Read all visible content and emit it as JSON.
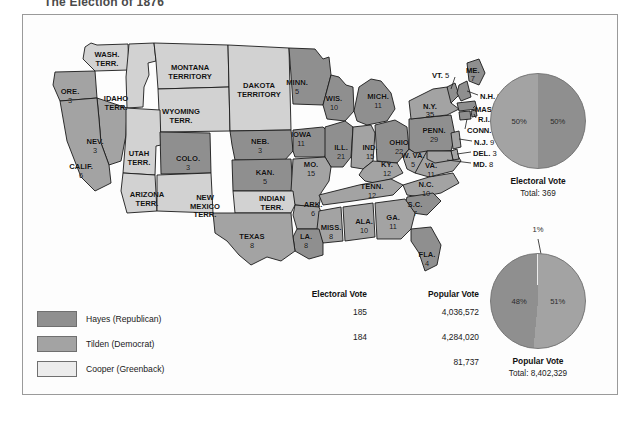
{
  "page_title": "The Election of 1876",
  "colors": {
    "hayes": "#8f8f8f",
    "tilden": "#a3a3a3",
    "cooper": "#ececec",
    "territory": "#d2d2d2",
    "outline": "#1a1a1a",
    "frame": "#9a9a9a"
  },
  "map": {
    "states": [
      {
        "name": "WASH.\nTERR.",
        "label": "WASH.",
        "label2": "TERR.",
        "ev": "",
        "party": "territory",
        "x": 84,
        "y": 42
      },
      {
        "name": "ORE.",
        "label": "ORE.",
        "label2": "",
        "ev": "3",
        "party": "tilden",
        "x": 47,
        "y": 79
      },
      {
        "name": "IDAHO TERR.",
        "label": "IDAHO",
        "label2": "TERR.",
        "ev": "",
        "party": "territory",
        "x": 93,
        "y": 86
      },
      {
        "name": "MONTANA TERRITORY",
        "label": "MONTANA",
        "label2": "TERRITORY",
        "ev": "",
        "party": "territory",
        "x": 167,
        "y": 55
      },
      {
        "name": "WYOMING TERR.",
        "label": "WYOMING",
        "label2": "TERR.",
        "ev": "",
        "party": "territory",
        "x": 158,
        "y": 99
      },
      {
        "name": "DAKOTA TERRITORY",
        "label": "DAKOTA",
        "label2": "TERRITORY",
        "ev": "",
        "party": "territory",
        "x": 236,
        "y": 73
      },
      {
        "name": "MINN.",
        "label": "MINN.",
        "label2": "",
        "ev": "5",
        "party": "hayes",
        "x": 274,
        "y": 70
      },
      {
        "name": "WIS.",
        "label": "WIS.",
        "label2": "",
        "ev": "10",
        "party": "hayes",
        "x": 311,
        "y": 86
      },
      {
        "name": "MICH.",
        "label": "MICH.",
        "label2": "",
        "ev": "11",
        "party": "hayes",
        "x": 355,
        "y": 84
      },
      {
        "name": "NEV.",
        "label": "NEV.",
        "label2": "",
        "ev": "3",
        "party": "tilden",
        "x": 72,
        "y": 129
      },
      {
        "name": "CALIF.",
        "label": "CALIF.",
        "label2": "",
        "ev": "6",
        "party": "tilden",
        "x": 58,
        "y": 154
      },
      {
        "name": "UTAH TERR.",
        "label": "UTAH",
        "label2": "TERR.",
        "ev": "",
        "party": "territory",
        "x": 116,
        "y": 141
      },
      {
        "name": "COLO.",
        "label": "COLO.",
        "label2": "",
        "ev": "3",
        "party": "hayes",
        "x": 165,
        "y": 146
      },
      {
        "name": "NEB.",
        "label": "NEB.",
        "label2": "",
        "ev": "3",
        "party": "hayes",
        "x": 237,
        "y": 129
      },
      {
        "name": "IOWA",
        "label": "IOWA",
        "label2": "",
        "ev": "11",
        "party": "hayes",
        "x": 278,
        "y": 122
      },
      {
        "name": "ILL.",
        "label": "ILL.",
        "label2": "",
        "ev": "21",
        "party": "hayes",
        "x": 318,
        "y": 135
      },
      {
        "name": "IND.",
        "label": "IND.",
        "label2": "",
        "ev": "15",
        "party": "tilden",
        "x": 347,
        "y": 135
      },
      {
        "name": "OHIO",
        "label": "OHIO",
        "label2": "",
        "ev": "22",
        "party": "hayes",
        "x": 376,
        "y": 130
      },
      {
        "name": "PENN.",
        "label": "PENN.",
        "label2": "",
        "ev": "29",
        "party": "hayes",
        "x": 411,
        "y": 118
      },
      {
        "name": "ARIZONA TERR.",
        "label": "ARIZONA",
        "label2": "TERR.",
        "ev": "",
        "party": "territory",
        "x": 124,
        "y": 182
      },
      {
        "name": "NEW MEXICO TERR.",
        "label": "NEW",
        "label2": "MEXICO",
        "label3": "TERR.",
        "ev": "",
        "party": "territory",
        "x": 182,
        "y": 185
      },
      {
        "name": "KAN.",
        "label": "KAN.",
        "label2": "",
        "ev": "5",
        "party": "hayes",
        "x": 242,
        "y": 160
      },
      {
        "name": "MO.",
        "label": "MO.",
        "label2": "",
        "ev": "15",
        "party": "tilden",
        "x": 288,
        "y": 152
      },
      {
        "name": "KY.",
        "label": "KY.",
        "label2": "",
        "ev": "12",
        "party": "tilden",
        "x": 364,
        "y": 152
      },
      {
        "name": "W. VA.",
        "label": "W. VA.",
        "label2": "",
        "ev": "5",
        "party": "tilden",
        "x": 390,
        "y": 143
      },
      {
        "name": "VA.",
        "label": "VA.",
        "label2": "",
        "ev": "11",
        "party": "tilden",
        "x": 408,
        "y": 153
      },
      {
        "name": "INDIAN TERR.",
        "label": "INDIAN",
        "label2": "TERR.",
        "ev": "",
        "party": "territory",
        "x": 249,
        "y": 186
      },
      {
        "name": "ARK.",
        "label": "ARK.",
        "label2": "",
        "ev": "6",
        "party": "tilden",
        "x": 290,
        "y": 192
      },
      {
        "name": "TENN.",
        "label": "TENN.",
        "label2": "",
        "ev": "12",
        "party": "tilden",
        "x": 349,
        "y": 174
      },
      {
        "name": "N.C.",
        "label": "N.C.",
        "label2": "",
        "ev": "10",
        "party": "tilden",
        "x": 403,
        "y": 172
      },
      {
        "name": "S.C.",
        "label": "S.C.",
        "label2": "",
        "ev": "7",
        "party": "hayes",
        "x": 392,
        "y": 192
      },
      {
        "name": "MISS.",
        "label": "MISS.",
        "label2": "",
        "ev": "8",
        "party": "tilden",
        "x": 308,
        "y": 215
      },
      {
        "name": "ALA.",
        "label": "ALA.",
        "label2": "",
        "ev": "10",
        "party": "tilden",
        "x": 341,
        "y": 209
      },
      {
        "name": "GA.",
        "label": "GA.",
        "label2": "",
        "ev": "11",
        "party": "tilden",
        "x": 370,
        "y": 205
      },
      {
        "name": "LA.",
        "label": "LA.",
        "label2": "",
        "ev": "8",
        "party": "hayes",
        "x": 283,
        "y": 224
      },
      {
        "name": "TEXAS",
        "label": "TEXAS",
        "label2": "",
        "ev": "8",
        "party": "tilden",
        "x": 229,
        "y": 224
      },
      {
        "name": "FLA.",
        "label": "FLA.",
        "label2": "",
        "ev": "4",
        "party": "hayes",
        "x": 404,
        "y": 242
      }
    ],
    "callouts": [
      {
        "name": "VT.",
        "ev": "5",
        "x": 409,
        "y": 57
      },
      {
        "name": "ME.",
        "ev": "7",
        "x": 443,
        "y": 52,
        "stacked": true
      },
      {
        "name": "N.Y.",
        "ev": "35",
        "x": 400,
        "y": 88,
        "stacked": true
      },
      {
        "name": "N.H.",
        "ev": "5",
        "x": 457,
        "y": 78
      },
      {
        "name": "MASS.",
        "ev": "13",
        "x": 452,
        "y": 91
      },
      {
        "name": "R.I.",
        "ev": "4",
        "x": 455,
        "y": 101
      },
      {
        "name": "CONN.",
        "ev": "6",
        "x": 444,
        "y": 112
      },
      {
        "name": "N.J.",
        "ev": "9",
        "x": 451,
        "y": 124
      },
      {
        "name": "DEL.",
        "ev": "3",
        "x": 450,
        "y": 135
      },
      {
        "name": "MD.",
        "ev": "8",
        "x": 450,
        "y": 146
      }
    ]
  },
  "legend": {
    "items": [
      {
        "label": "Hayes (Republican)",
        "party": "hayes"
      },
      {
        "label": "Tilden (Democrat)",
        "party": "tilden"
      },
      {
        "label": "Cooper (Greenback)",
        "party": "cooper"
      }
    ]
  },
  "table": {
    "headers": {
      "electoral": "Electoral Vote",
      "popular": "Popular Vote"
    },
    "rows": [
      {
        "electoral": "185",
        "popular": "4,036,572"
      },
      {
        "electoral": "184",
        "popular": "4,284,020"
      },
      {
        "electoral": "",
        "popular": "81,737"
      }
    ]
  },
  "chart_data": [
    {
      "type": "pie",
      "title": "Electoral Vote",
      "total_label": "Total: 369",
      "total": 369,
      "categories": [
        "Hayes (Republican)",
        "Tilden (Democrat)"
      ],
      "values": [
        50,
        50
      ],
      "labels": [
        "50%",
        "50%"
      ],
      "colors": [
        "#8f8f8f",
        "#a3a3a3"
      ],
      "legend_position": "external-left"
    },
    {
      "type": "pie",
      "title": "Popular Vote",
      "total_label": "Total: 8,402,329",
      "total": 8402329,
      "categories": [
        "Tilden (Democrat)",
        "Hayes (Republican)",
        "Cooper (Greenback)"
      ],
      "values": [
        51,
        48,
        1
      ],
      "labels": [
        "51%",
        "48%",
        "1%"
      ],
      "colors": [
        "#a3a3a3",
        "#8f8f8f",
        "#ececec"
      ],
      "legend_position": "external-left"
    }
  ],
  "pies": {
    "electoral": {
      "caption": "Electoral Vote",
      "total": "Total: 369",
      "left_pct": "50%",
      "right_pct": "50%"
    },
    "popular": {
      "caption": "Popular Vote",
      "total": "Total: 8,402,329",
      "left_pct": "48%",
      "right_pct": "51%",
      "sliver_pct": "1%"
    }
  }
}
